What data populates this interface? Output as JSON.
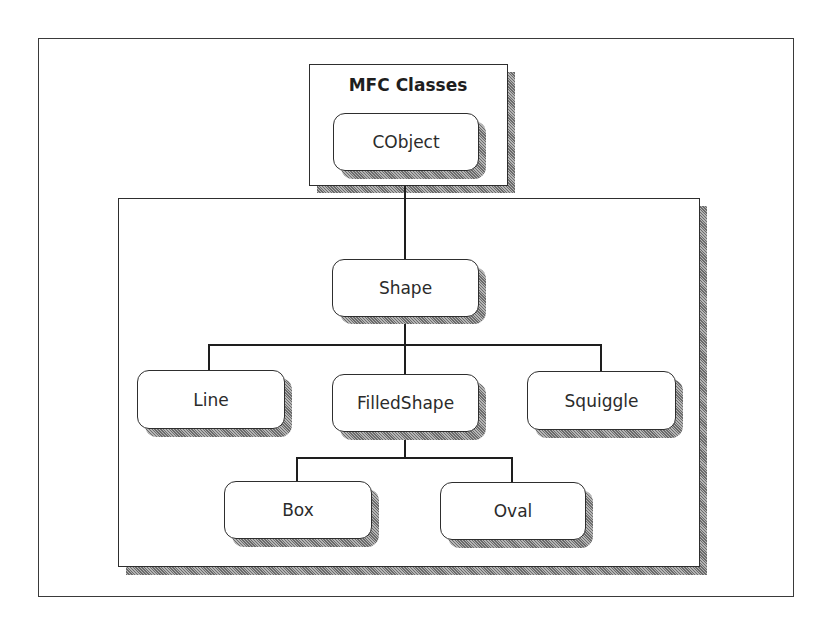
{
  "diagram": {
    "type": "class-hierarchy",
    "group_title": "MFC Classes",
    "nodes": {
      "cobject": "CObject",
      "shape": "Shape",
      "line": "Line",
      "filledshape": "FilledShape",
      "squiggle": "Squiggle",
      "box": "Box",
      "oval": "Oval"
    },
    "edges": [
      {
        "from": "CObject",
        "to": "Shape"
      },
      {
        "from": "Shape",
        "to": "Line"
      },
      {
        "from": "Shape",
        "to": "FilledShape"
      },
      {
        "from": "Shape",
        "to": "Squiggle"
      },
      {
        "from": "FilledShape",
        "to": "Box"
      },
      {
        "from": "FilledShape",
        "to": "Oval"
      }
    ],
    "colors": {
      "line": "#1e1e1e",
      "shadow": "#8a8a8a",
      "background": "#ffffff"
    }
  }
}
